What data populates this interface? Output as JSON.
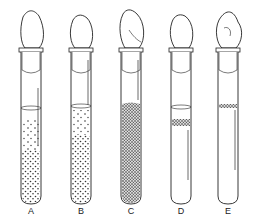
{
  "figure": {
    "type": "test-tube-culture-illustration",
    "tubes": [
      {
        "label": "A",
        "growth": "dispersed, denser toward bottom",
        "x": 19
      },
      {
        "label": "B",
        "growth": "dispersed throughout, dense",
        "x": 69
      },
      {
        "label": "C",
        "growth": "uniformly dense throughout",
        "x": 119
      },
      {
        "label": "D",
        "growth": "band just below surface",
        "x": 169
      },
      {
        "label": "E",
        "growth": "thin layer at surface",
        "x": 216
      }
    ],
    "colors": {
      "ink": "#222222",
      "background": "#ffffff"
    }
  }
}
